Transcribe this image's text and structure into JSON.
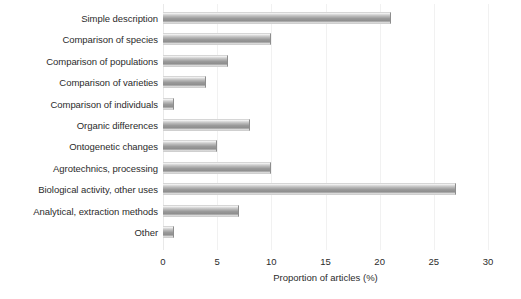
{
  "chart_data": {
    "type": "bar",
    "orientation": "horizontal",
    "title": "",
    "xlabel": "Proportion of articles (%)",
    "ylabel": "",
    "xlim": [
      0,
      30
    ],
    "xticks": [
      0,
      5,
      10,
      15,
      20,
      25,
      30
    ],
    "xtick_labels": [
      "0",
      "5",
      "10",
      "15",
      "20",
      "25",
      "30"
    ],
    "grid": true,
    "legend": "none",
    "bar_color": "#9a9a9a",
    "categories": [
      "Simple description",
      "Comparison of species",
      "Comparison of populations",
      "Comparison of varieties",
      "Comparison of individuals",
      "Organic differences",
      "Ontogenetic changes",
      "Agrotechnics, processing",
      "Biological activity, other uses",
      "Analytical, extraction methods",
      "Other"
    ],
    "values": [
      21,
      10,
      6,
      4,
      1,
      8,
      5,
      10,
      27,
      7,
      1
    ]
  }
}
